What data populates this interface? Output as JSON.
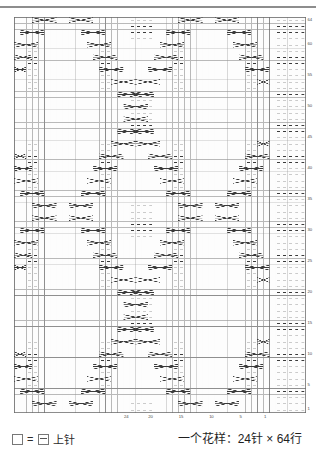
{
  "chart_data": {
    "type": "table",
    "title": "",
    "subtitle": "",
    "xlabel": "",
    "ylabel": "",
    "grid": true,
    "columns": 48,
    "rows": 64,
    "pattern_repeat_stitches": 24,
    "pattern_repeat_rows": 64,
    "col_tick_labels": [
      "24",
      "20",
      "15",
      "10",
      "5",
      "1"
    ],
    "col_tick_positions": [
      24,
      20,
      15,
      10,
      5,
      1
    ],
    "row_tick_labels": [
      "64",
      "60",
      "55",
      "50",
      "45",
      "40",
      "35",
      "30",
      "25",
      "20",
      "15",
      "10",
      "5",
      "1"
    ],
    "row_tick_positions": [
      64,
      60,
      55,
      50,
      45,
      40,
      35,
      30,
      25,
      20,
      15,
      10,
      5,
      1
    ],
    "symbols": {
      "blank": "knit stitch (plain square)",
      "dash": "purl stitch (horizontal bar)",
      "cross": "cable cross (4-stitch travelling stitch)"
    },
    "divider_column": 42,
    "purl_columns_right_panel": [
      43,
      44,
      45,
      46,
      47
    ]
  },
  "legend": {
    "blank_symbol": "□",
    "equals": "=",
    "purl_symbol": "⊟",
    "label": "上针"
  },
  "caption": {
    "text": "一个花样：24针 × 64行"
  },
  "colors": {
    "grid_line": "#b9b9b9",
    "grid_line_major": "#6b6b6b",
    "symbol": "#3a3a3a",
    "page_background": "#ffffff",
    "rule": "#8d8d8d"
  }
}
